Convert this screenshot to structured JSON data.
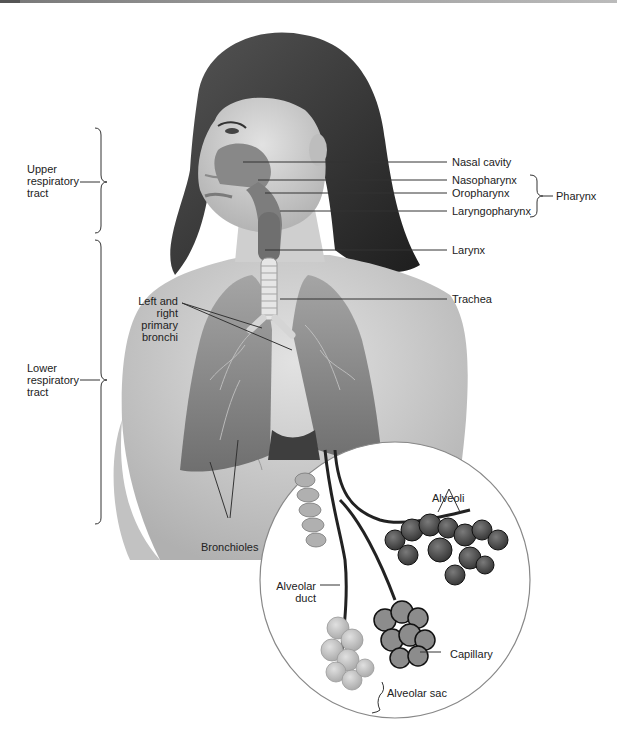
{
  "figure": {
    "labels": {
      "upper_tract": [
        "Upper",
        "respiratory",
        "tract"
      ],
      "lower_tract": [
        "Lower",
        "respiratory",
        "tract"
      ],
      "nasal_cavity": "Nasal cavity",
      "nasopharynx": "Nasopharynx",
      "oropharynx": "Oropharynx",
      "laryngopharynx": "Laryngopharynx",
      "pharynx": "Pharynx",
      "larynx": "Larynx",
      "trachea": "Trachea",
      "primary_bronchi": [
        "Left and",
        "right",
        "primary",
        "bronchi"
      ],
      "bronchioles": "Bronchioles",
      "alveoli": "Alveoli",
      "alveolar_duct": [
        "Alveolar",
        "duct"
      ],
      "capillary": "Capillary",
      "alveolar_sac": "Alveolar sac"
    },
    "colors": {
      "label_text": "#222222",
      "leader_line": "#333333",
      "skin": "#c9c9c9",
      "hair": "#3a3a3a",
      "lung": "#8a8a8a",
      "inset_border": "#888888"
    }
  }
}
